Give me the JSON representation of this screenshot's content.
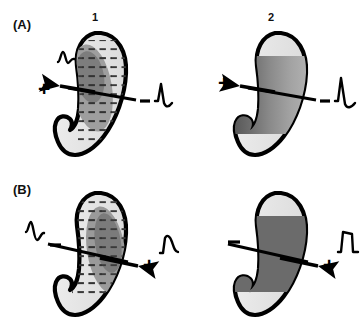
{
  "figure": {
    "type": "cardiac-depolarization-vector-diagram",
    "panels": [
      {
        "id": "A",
        "label": "(A)",
        "columns": [
          {
            "id": "A1",
            "number": "1",
            "ventricle_fill": "hatched-stipple",
            "activation_region": "left-mid-dark-ellipse",
            "vector_direction": "left",
            "left_electrode_sign": "+",
            "right_electrode_sign": "−",
            "left_waveform": "upward-spike-then-dip",
            "right_waveform": "upward-spike-then-dip"
          },
          {
            "id": "A2",
            "number": "2",
            "ventricle_fill": "horizontal-gradient-bands",
            "activation_region": "full-mid-band",
            "vector_direction": "left",
            "left_electrode_sign": "+",
            "right_electrode_sign": "−",
            "left_waveform": "none",
            "right_waveform": "tall-upward-spike-then-dip"
          }
        ]
      },
      {
        "id": "B",
        "label": "(B)",
        "columns": [
          {
            "id": "B1",
            "number": "1",
            "ventricle_fill": "hatched-stipple",
            "activation_region": "right-mid-dark-ellipse",
            "vector_direction": "right",
            "left_electrode_sign": "−",
            "right_electrode_sign": "+",
            "left_waveform": "spike-then-downward-dip",
            "right_waveform": "rounded-positive-hump"
          },
          {
            "id": "B2",
            "number": "2",
            "ventricle_fill": "solid-dark-band",
            "activation_region": "full-mid-band",
            "vector_direction": "right",
            "left_electrode_sign": "−",
            "right_electrode_sign": "+",
            "left_waveform": "none",
            "right_waveform": "broad-positive-plateau"
          }
        ]
      }
    ]
  },
  "labels": {
    "panel_a": "(A)",
    "panel_b": "(B)",
    "column_1": "1",
    "column_2": "2",
    "plus": "+",
    "minus": "–"
  },
  "colors": {
    "outline": "#000000",
    "background": "#ffffff",
    "myocardium_light": "#e6e6e6",
    "myocardium_mid": "#c0c0c0",
    "activation_dark": "#6e6e6e",
    "activation_darker": "#595959",
    "hatch_mark": "#3a3a3a"
  }
}
